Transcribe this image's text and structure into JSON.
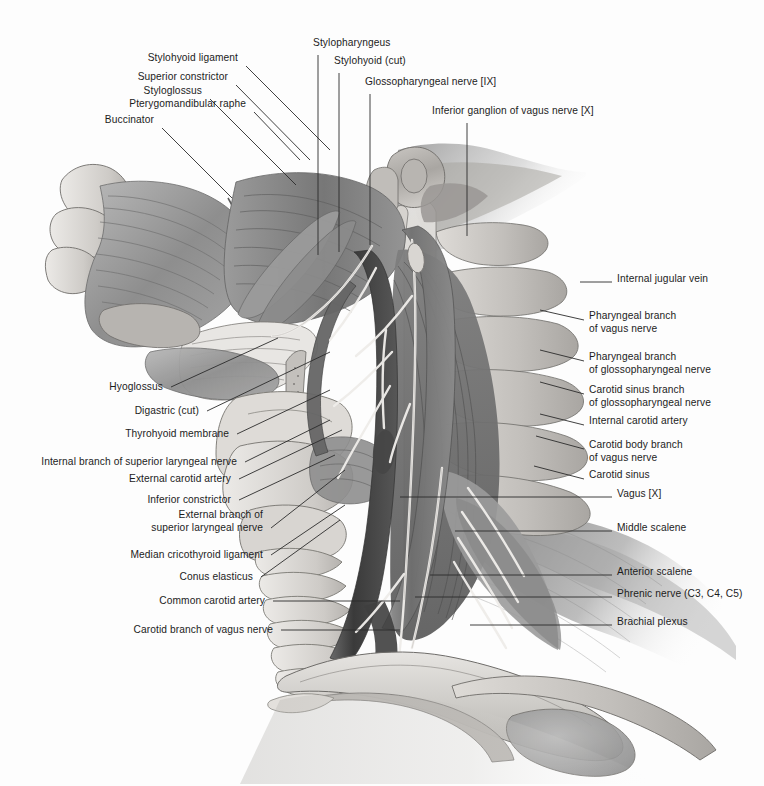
{
  "plate": {
    "title": "Pharynx, larynx and cervical neurovascular structures — lateral view",
    "style": "grayscale medical atlas illustration",
    "background_color": "#fdfdfd",
    "text_color": "#1c1c1c",
    "leader_color": "#2b2b2b",
    "width": 764,
    "height": 786
  },
  "labels_left": [
    {
      "text": "Stylohyoid ligament",
      "tx": 238,
      "ty": 61,
      "ax": 246,
      "ay": 66,
      "bx": 330,
      "by": 150
    },
    {
      "text": "Superior constrictor",
      "tx": 228,
      "ty": 80,
      "ax": 236,
      "ay": 85,
      "bx": 310,
      "by": 160
    },
    {
      "text": "Styloglossus",
      "tx": 202,
      "ty": 94,
      "ax": 210,
      "ay": 99,
      "bx": 296,
      "by": 185
    },
    {
      "text": "Pterygomandibular raphe",
      "tx": 246,
      "ty": 107,
      "ax": 254,
      "ay": 112,
      "bx": 300,
      "by": 160
    },
    {
      "text": "Buccinator",
      "tx": 154,
      "ty": 123,
      "ax": 162,
      "ay": 128,
      "bx": 232,
      "by": 198
    },
    {
      "text": "Hyoglossus",
      "tx": 163,
      "ty": 390,
      "ax": 171,
      "ay": 387,
      "bx": 278,
      "by": 338
    },
    {
      "text": "Digastric (cut)",
      "tx": 199,
      "ty": 414,
      "ax": 207,
      "ay": 411,
      "bx": 330,
      "by": 352
    },
    {
      "text": "Thyrohyoid membrane",
      "tx": 229,
      "ty": 437,
      "ax": 237,
      "ay": 434,
      "bx": 330,
      "by": 390
    },
    {
      "text": "Internal branch of superior laryngeal nerve",
      "tx": 237,
      "ty": 465,
      "ax": 245,
      "ay": 462,
      "bx": 330,
      "by": 420
    },
    {
      "text": "External carotid artery",
      "tx": 231,
      "ty": 482,
      "ax": 239,
      "ay": 479,
      "bx": 342,
      "by": 430
    },
    {
      "text": "Inferior constrictor",
      "tx": 231,
      "ty": 503,
      "ax": 239,
      "ay": 500,
      "bx": 335,
      "by": 455
    },
    {
      "text": "External branch of",
      "tx": 263,
      "ty": 518,
      "ax": 0,
      "ay": 0,
      "bx": 0,
      "by": 0
    },
    {
      "text": "superior laryngeal nerve",
      "tx": 263,
      "ty": 531,
      "ax": 271,
      "ay": 528,
      "bx": 345,
      "by": 470
    },
    {
      "text": "Median cricothyroid ligament",
      "tx": 263,
      "ty": 558,
      "ax": 271,
      "ay": 555,
      "bx": 345,
      "by": 505
    },
    {
      "text": "Conus elasticus",
      "tx": 253,
      "ty": 580,
      "ax": 261,
      "ay": 577,
      "bx": 340,
      "by": 520
    },
    {
      "text": "Common carotid artery",
      "tx": 265,
      "ty": 604,
      "ax": 273,
      "ay": 601,
      "bx": 400,
      "by": 601
    },
    {
      "text": "Carotid branch of vagus nerve",
      "tx": 273,
      "ty": 633,
      "ax": 281,
      "ay": 630,
      "bx": 400,
      "by": 630
    }
  ],
  "labels_top": [
    {
      "text": "Stylopharyngeus",
      "tx": 313,
      "ty": 46,
      "ax": 318,
      "ay": 55,
      "bx": 318,
      "by": 255
    },
    {
      "text": "Stylohyoid (cut)",
      "tx": 334,
      "ty": 64,
      "ax": 339,
      "ay": 73,
      "bx": 339,
      "by": 252
    },
    {
      "text": "Glossopharyngeal nerve [IX]",
      "tx": 365,
      "ty": 85,
      "ax": 370,
      "ay": 94,
      "bx": 370,
      "by": 245
    },
    {
      "text": "Inferior ganglion of vagus nerve [X]",
      "tx": 432,
      "ty": 114,
      "ax": 467,
      "ay": 123,
      "bx": 467,
      "by": 236
    }
  ],
  "labels_right": [
    {
      "text": "Internal jugular vein",
      "tx": 617,
      "ty": 282,
      "ax": 612,
      "ay": 282,
      "bx": 580,
      "by": 282
    },
    {
      "text": "Pharyngeal branch",
      "tx": 589,
      "ty": 319,
      "ax": 0,
      "ay": 0,
      "bx": 0,
      "by": 0
    },
    {
      "text": "of vagus nerve",
      "tx": 589,
      "ty": 332,
      "ax": 584,
      "ay": 320,
      "bx": 540,
      "by": 310
    },
    {
      "text": "Pharyngeal branch",
      "tx": 589,
      "ty": 360,
      "ax": 0,
      "ay": 0,
      "bx": 0,
      "by": 0
    },
    {
      "text": "of glossopharyngeal nerve",
      "tx": 589,
      "ty": 373,
      "ax": 584,
      "ay": 361,
      "bx": 540,
      "by": 350
    },
    {
      "text": "Carotid sinus branch",
      "tx": 589,
      "ty": 393,
      "ax": 0,
      "ay": 0,
      "bx": 0,
      "by": 0
    },
    {
      "text": "of glossopharyngeal nerve",
      "tx": 589,
      "ty": 406,
      "ax": 584,
      "ay": 394,
      "bx": 540,
      "by": 382
    },
    {
      "text": "Internal carotid artery",
      "tx": 589,
      "ty": 424,
      "ax": 584,
      "ay": 425,
      "bx": 540,
      "by": 414
    },
    {
      "text": "Carotid body branch",
      "tx": 589,
      "ty": 448,
      "ax": 0,
      "ay": 0,
      "bx": 0,
      "by": 0
    },
    {
      "text": "of vagus nerve",
      "tx": 589,
      "ty": 461,
      "ax": 584,
      "ay": 449,
      "bx": 536,
      "by": 436
    },
    {
      "text": "Carotid sinus",
      "tx": 589,
      "ty": 478,
      "ax": 584,
      "ay": 479,
      "bx": 534,
      "by": 466
    },
    {
      "text": "Vagus [X]",
      "tx": 617,
      "ty": 497,
      "ax": 612,
      "ay": 497,
      "bx": 400,
      "by": 497
    },
    {
      "text": "Middle scalene",
      "tx": 617,
      "ty": 531,
      "ax": 612,
      "ay": 531,
      "bx": 455,
      "by": 531
    },
    {
      "text": "Anterior scalene",
      "tx": 617,
      "ty": 575,
      "ax": 612,
      "ay": 575,
      "bx": 430,
      "by": 575
    },
    {
      "text": "Phrenic nerve (C3, C4, C5)",
      "tx": 617,
      "ty": 597,
      "ax": 612,
      "ay": 597,
      "bx": 415,
      "by": 597
    },
    {
      "text": "Brachial plexus",
      "tx": 617,
      "ty": 625,
      "ax": 612,
      "ay": 625,
      "bx": 470,
      "by": 625
    }
  ],
  "icons": {
    "artwork": "anatomy-illustration"
  }
}
